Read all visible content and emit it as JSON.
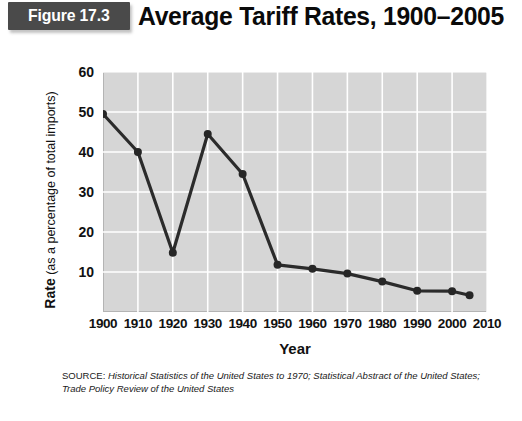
{
  "figure": {
    "badge_label": "Figure 17.3",
    "title": "Average Tariff Rates, 1900–2005"
  },
  "source": {
    "lead": "SOURCE: ",
    "citation": "Historical Statistics of the United States to 1970; Statistical Abstract of the United States; Trade Policy Review of the United States"
  },
  "colors": {
    "badge_background": "#4a4a4a",
    "badge_text": "#ffffff",
    "title_text": "#0a0a0a",
    "plot_background": "#d6d6d6",
    "gridline": "#ffffff",
    "series_line": "#2b2b2b",
    "marker": "#262626"
  },
  "chart_data": {
    "type": "line",
    "title": "Average Tariff Rates, 1900–2005",
    "xlabel": "Year",
    "ylabel": "Rate (as a percentage of total imports)",
    "ylabel_bold_part": "Rate",
    "ylabel_rest": "(as a percentage of total imports)",
    "xlim": [
      1900,
      2010
    ],
    "ylim": [
      0,
      60
    ],
    "xticks": [
      1900,
      1910,
      1920,
      1930,
      1940,
      1950,
      1960,
      1970,
      1980,
      1990,
      2000,
      2010
    ],
    "yticks": [
      10,
      20,
      30,
      40,
      50,
      60
    ],
    "grid": true,
    "legend": "none",
    "x": [
      1900,
      1910,
      1920,
      1930,
      1940,
      1950,
      1960,
      1970,
      1980,
      1990,
      2000,
      2005
    ],
    "values": [
      49.5,
      40.0,
      14.8,
      44.5,
      34.5,
      11.8,
      10.8,
      9.6,
      7.6,
      5.3,
      5.2,
      4.2
    ],
    "series": [
      {
        "name": "Average tariff rate",
        "values": [
          49.5,
          40.0,
          14.8,
          44.5,
          34.5,
          11.8,
          10.8,
          9.6,
          7.6,
          5.3,
          5.2,
          4.2
        ]
      }
    ]
  }
}
